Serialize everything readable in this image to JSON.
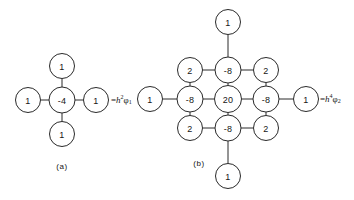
{
  "figure": {
    "background_color": "#ffffff",
    "stroke_color": "#2a2a2a",
    "text_color": "#151515"
  },
  "stencils": [
    {
      "id": "stencil-a",
      "caption": "(a)",
      "caption_x": 62,
      "caption_y": 166,
      "operator": "five-point-laplacian",
      "center": {
        "x": 62,
        "y": 100
      },
      "node_radius": 12.5,
      "nodes": [
        {
          "name": "center",
          "value": "-4",
          "dx": 0,
          "dy": 0,
          "r": 13
        },
        {
          "name": "north",
          "value": "1",
          "dx": 0,
          "dy": -34,
          "r": 12.5
        },
        {
          "name": "south",
          "value": "1",
          "dx": 0,
          "dy": 34,
          "r": 12.5
        },
        {
          "name": "west",
          "value": "1",
          "dx": -34,
          "dy": 0,
          "r": 12.5
        },
        {
          "name": "east",
          "value": "1",
          "dx": 34,
          "dy": 0,
          "r": 12.5
        }
      ],
      "edges": [
        {
          "from": "center",
          "to": "north"
        },
        {
          "from": "center",
          "to": "south"
        },
        {
          "from": "center",
          "to": "west"
        },
        {
          "from": "center",
          "to": "east"
        }
      ],
      "rhs": {
        "equals": "=",
        "coefficient": "h",
        "exponent": "2",
        "symbol": "φ",
        "subscript": "1",
        "x": 111,
        "y": 100
      }
    },
    {
      "id": "stencil-b",
      "caption": "(b)",
      "caption_x": 199,
      "caption_y": 163,
      "operator": "thirteen-point-biharmonic",
      "center": {
        "x": 228,
        "y": 99
      },
      "node_radius": 12.5,
      "nodes": [
        {
          "name": "center",
          "value": "20",
          "dx": 0,
          "dy": 0,
          "r": 13.5
        },
        {
          "name": "north-1",
          "value": "-8",
          "dx": 0,
          "dy": -29,
          "r": 13
        },
        {
          "name": "south-1",
          "value": "-8",
          "dx": 0,
          "dy": 29,
          "r": 13
        },
        {
          "name": "west-1",
          "value": "-8",
          "dx": -38,
          "dy": 0,
          "r": 13
        },
        {
          "name": "east-1",
          "value": "-8",
          "dx": 38,
          "dy": 0,
          "r": 13
        },
        {
          "name": "northwest",
          "value": "2",
          "dx": -38,
          "dy": -29,
          "r": 12.5
        },
        {
          "name": "northeast",
          "value": "2",
          "dx": 38,
          "dy": -29,
          "r": 12.5
        },
        {
          "name": "southwest",
          "value": "2",
          "dx": -38,
          "dy": 29,
          "r": 12.5
        },
        {
          "name": "southeast",
          "value": "2",
          "dx": 38,
          "dy": 29,
          "r": 12.5
        },
        {
          "name": "north-2",
          "value": "1",
          "dx": 0,
          "dy": -77,
          "r": 12.5
        },
        {
          "name": "south-2",
          "value": "1",
          "dx": 0,
          "dy": 77,
          "r": 12.5
        },
        {
          "name": "west-2",
          "value": "1",
          "dx": -78,
          "dy": 0,
          "r": 12.5
        },
        {
          "name": "east-2",
          "value": "1",
          "dx": 78,
          "dy": 0,
          "r": 12.5
        }
      ],
      "edges": [
        {
          "from": "center",
          "to": "north-1"
        },
        {
          "from": "center",
          "to": "south-1"
        },
        {
          "from": "center",
          "to": "west-1"
        },
        {
          "from": "center",
          "to": "east-1"
        },
        {
          "from": "north-1",
          "to": "north-2"
        },
        {
          "from": "south-1",
          "to": "south-2"
        },
        {
          "from": "west-1",
          "to": "west-2"
        },
        {
          "from": "east-1",
          "to": "east-2"
        },
        {
          "from": "north-1",
          "to": "northwest"
        },
        {
          "from": "north-1",
          "to": "northeast"
        },
        {
          "from": "south-1",
          "to": "southwest"
        },
        {
          "from": "south-1",
          "to": "southeast"
        },
        {
          "from": "west-1",
          "to": "northwest"
        },
        {
          "from": "west-1",
          "to": "southwest"
        },
        {
          "from": "east-1",
          "to": "northeast"
        },
        {
          "from": "east-1",
          "to": "southeast"
        }
      ],
      "rhs": {
        "equals": "=",
        "coefficient": "h",
        "exponent": "4",
        "symbol": "φ",
        "subscript": "2",
        "x": 320,
        "y": 99
      }
    }
  ]
}
